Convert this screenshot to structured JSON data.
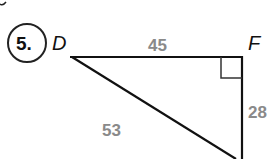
{
  "problem": {
    "number": "5."
  },
  "triangle": {
    "vertices": {
      "top_left": "D",
      "top_right": "F"
    },
    "sides": {
      "DF": "45",
      "F_vertical": "28",
      "hypotenuse": "53"
    },
    "right_angle_at": "F"
  }
}
